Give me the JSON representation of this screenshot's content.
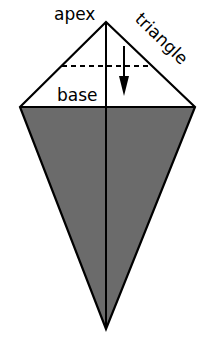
{
  "diagram": {
    "labels": {
      "apex": "apex",
      "triangle": "triangle",
      "base": "base"
    },
    "colors": {
      "fill": "#6b6b6b",
      "stroke": "#000000",
      "background": "#ffffff"
    },
    "geometry": {
      "apex": [
        106,
        22
      ],
      "left": [
        20,
        107
      ],
      "right": [
        195,
        107
      ],
      "bottom": [
        106,
        329
      ],
      "dashed_line_y": 66,
      "arrow_x": 124
    }
  }
}
